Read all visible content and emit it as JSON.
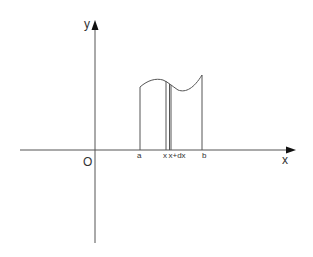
{
  "diagram": {
    "type": "definite-integral-area-element",
    "axes": {
      "x_label": "x",
      "y_label": "y",
      "origin_label": "O"
    },
    "points": {
      "a_label": "a",
      "x_label": "x",
      "x_dx_label": "x+dx",
      "b_label": "b"
    },
    "colors": {
      "line": "#555555",
      "axis": "#444444",
      "arrow": "#111111",
      "text": "#333333"
    }
  }
}
